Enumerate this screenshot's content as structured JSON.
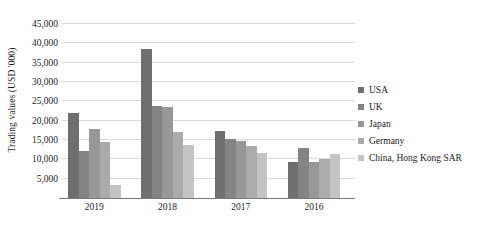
{
  "chart_data": {
    "type": "bar",
    "title": "",
    "subtitle": "",
    "xlabel": "",
    "ylabel": "Trading values (USD '000)",
    "categories": [
      "2019",
      "2018",
      "2017",
      "2016"
    ],
    "series": [
      {
        "name": "USA",
        "color": "#6f6f6f",
        "values": [
          22000,
          38500,
          17400,
          9200
        ]
      },
      {
        "name": "UK",
        "color": "#848484",
        "values": [
          12200,
          23800,
          15200,
          13000
        ]
      },
      {
        "name": "Japan",
        "color": "#989898",
        "values": [
          17800,
          23500,
          14700,
          9300
        ]
      },
      {
        "name": "Germany",
        "color": "#ababab",
        "values": [
          14600,
          17200,
          13500,
          10200
        ]
      },
      {
        "name": "China, Hong Kong SAR",
        "color": "#c4c4c4",
        "values": [
          3300,
          13600,
          11700,
          11300
        ]
      }
    ],
    "ylim": [
      0,
      45000
    ],
    "ytick_values": [
      5000,
      10000,
      15000,
      20000,
      25000,
      30000,
      35000,
      40000,
      45000
    ],
    "ytick_labels": [
      "5,000",
      "10,000",
      "15,000",
      "20,000",
      "25,000",
      "30,000",
      "35,000",
      "40,000",
      "45,000"
    ],
    "grid": true,
    "legend_position": "right",
    "background_color": "#ffffff",
    "gridline_color": "#d9d9d9",
    "axis_color": "#7a7a7a",
    "text_color": "#1c1c1c"
  }
}
